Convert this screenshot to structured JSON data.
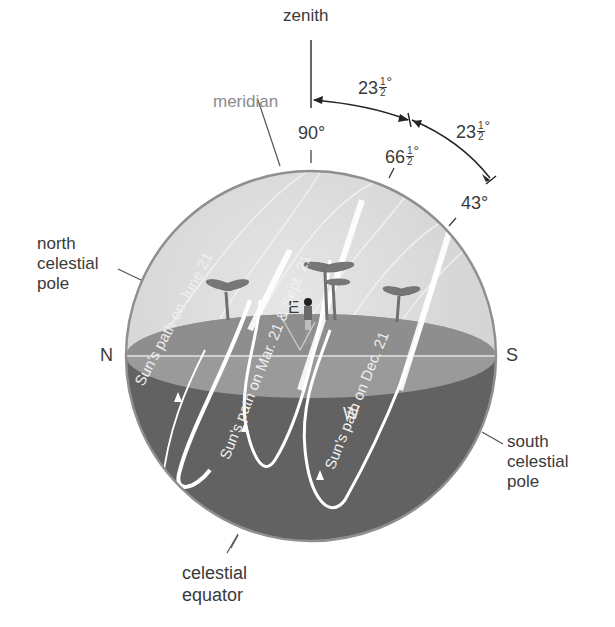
{
  "diagram": {
    "labels": {
      "zenith": "zenith",
      "meridian": "meridian",
      "north_celestial_pole": [
        "north",
        "celestial",
        "pole"
      ],
      "south_celestial_pole": [
        "south",
        "celestial",
        "pole"
      ],
      "celestial_equator": [
        "celestial",
        "equator"
      ],
      "north": "N",
      "south": "S",
      "east": "E",
      "west": "W"
    },
    "angles": {
      "zenith_to_equinox_arc": {
        "whole": "23",
        "num": "1",
        "den": "2",
        "unit": "°"
      },
      "equinox_to_dec_arc": {
        "whole": "23",
        "num": "1",
        "den": "2",
        "unit": "°"
      },
      "altitude_june": "90°",
      "altitude_equinox": {
        "whole": "66",
        "num": "1",
        "den": "2",
        "unit": "°"
      },
      "altitude_dec": "43°"
    },
    "sun_paths": [
      {
        "label": "Sun's path on June 21"
      },
      {
        "label": "Sun's path on Mar. 21 & Sept. 21"
      },
      {
        "label": "Sun's path on Dec. 21"
      }
    ],
    "colors": {
      "upper_sky": "#d9d9d9",
      "horizon_plane": "#9a9a9a",
      "horizon_far": "#8c8c8c",
      "lower_sphere": "#626262",
      "outline": "#8f8f8f",
      "path": "#ffffff",
      "text": "#3a3a3a",
      "meridian_text": "#8a8a8a"
    }
  }
}
